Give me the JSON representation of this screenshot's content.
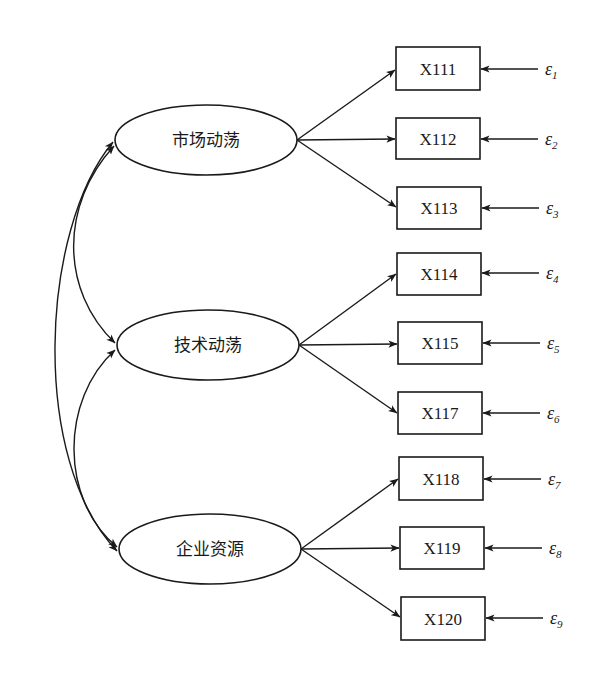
{
  "diagram": {
    "type": "structural-equation-model",
    "latent_factors": [
      {
        "id": "F1",
        "label": "市场动荡",
        "cx": 206,
        "cy": 140,
        "rx": 91,
        "ry": 35
      },
      {
        "id": "F2",
        "label": "技术动荡",
        "cx": 208,
        "cy": 345,
        "rx": 91,
        "ry": 35
      },
      {
        "id": "F3",
        "label": "企业资源",
        "cx": 210,
        "cy": 549,
        "rx": 91,
        "ry": 35
      }
    ],
    "indicators": [
      {
        "label": "X111",
        "factor": "F1",
        "x": 396,
        "y": 47,
        "error": "ε",
        "error_sub": "1"
      },
      {
        "label": "X112",
        "factor": "F1",
        "x": 396,
        "y": 118,
        "error": "ε",
        "error_sub": "2"
      },
      {
        "label": "X113",
        "factor": "F1",
        "x": 397,
        "y": 187,
        "error": "ε",
        "error_sub": "3"
      },
      {
        "label": "X114",
        "factor": "F2",
        "x": 397,
        "y": 253,
        "error": "ε",
        "error_sub": "4"
      },
      {
        "label": "X115",
        "factor": "F2",
        "x": 398,
        "y": 322,
        "error": "ε",
        "error_sub": "5"
      },
      {
        "label": "X117",
        "factor": "F2",
        "x": 398,
        "y": 392,
        "error": "ε",
        "error_sub": "6"
      },
      {
        "label": "X118",
        "factor": "F3",
        "x": 399,
        "y": 457,
        "error": "ε",
        "error_sub": "7"
      },
      {
        "label": "X119",
        "factor": "F3",
        "x": 400,
        "y": 527,
        "error": "ε",
        "error_sub": "8"
      },
      {
        "label": "X120",
        "factor": "F3",
        "x": 401,
        "y": 597,
        "error": "ε",
        "error_sub": "9"
      }
    ],
    "covariances": [
      {
        "from": "F1",
        "to": "F2"
      },
      {
        "from": "F2",
        "to": "F3"
      },
      {
        "from": "F1",
        "to": "F3"
      }
    ],
    "colors": {
      "stroke": "#1a1a1a",
      "background": "#ffffff"
    }
  }
}
